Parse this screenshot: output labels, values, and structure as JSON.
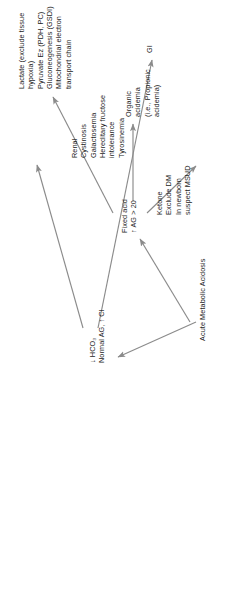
{
  "diagram": {
    "title": "Acute Metabolic Acidosis",
    "type": "decision-tree",
    "orientation": "rotated-90-ccw",
    "colors": {
      "background": "#ffffff",
      "text": "#1c1c1c",
      "arrow": "#8b8b8b"
    },
    "nodes": {
      "root": {
        "label": "Acute Metabolic Acidosis"
      },
      "fixed_acid": {
        "label": "Fixed acid\n↑ AG > 20"
      },
      "lactate": {
        "label": "Lactate (exclude tissue\n    hypoxia)\nPyruvate Ez (PDH, PC)\nGluconeogenesis (GSDI)\nMitochondrial electron\n    transport chain"
      },
      "organic_acidemia": {
        "label": "Organic\nacidemia\n(i.e., Propionic\n   acidemia)"
      },
      "ketone": {
        "label": "Ketone\nExclude DM\nIn newborn\n   suspect MSUD"
      },
      "low_hco3": {
        "label": "↓ HCO₃\nNormal AG, ↑ Cl"
      },
      "renal": {
        "label": "Renal\nCystinosis\nGalactosemia\nHereditary fructose\n   intolerance\nTyrosinemia"
      },
      "gi": {
        "label": "GI"
      }
    },
    "edges": [
      {
        "from": "root",
        "to": "fixed_acid"
      },
      {
        "from": "root",
        "to": "low_hco3"
      },
      {
        "from": "fixed_acid",
        "to": "lactate"
      },
      {
        "from": "fixed_acid",
        "to": "organic_acidemia"
      },
      {
        "from": "fixed_acid",
        "to": "ketone"
      },
      {
        "from": "low_hco3",
        "to": "renal"
      },
      {
        "from": "low_hco3",
        "to": "gi"
      }
    ]
  }
}
